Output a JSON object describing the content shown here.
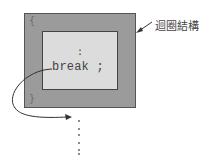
{
  "diagram": {
    "outer_block": {
      "label": "迴圈結構",
      "open_brace": "{",
      "close_brace": "}"
    },
    "inner_block": {
      "ellipsis": ":",
      "statement": "break ;"
    },
    "continuation_dots": "⋮"
  },
  "colors": {
    "outer_fill": "#9b9b9b",
    "inner_fill": "#dcdcdc",
    "stroke": "#444444"
  }
}
